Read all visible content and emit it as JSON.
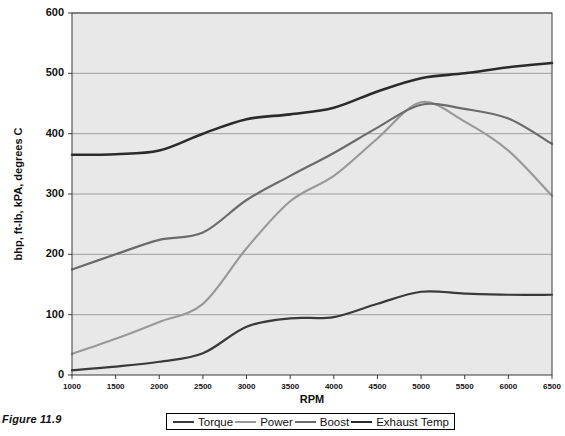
{
  "figure": {
    "caption": "Figure 11.9"
  },
  "chart_data": {
    "type": "line",
    "title": "",
    "xlabel": "RPM",
    "ylabel": "bhp, ft-lb, kPA, degrees C",
    "xlim": [
      1000,
      6500
    ],
    "ylim": [
      0,
      600
    ],
    "xticks": [
      1000,
      1500,
      2000,
      2500,
      3000,
      3500,
      4000,
      4500,
      5000,
      5500,
      6000,
      6500
    ],
    "yticks": [
      0,
      100,
      200,
      300,
      400,
      500,
      600
    ],
    "grid": "horizontal",
    "legend_position": "bottom",
    "plot_background": "#e8e8e8",
    "x": [
      1000,
      1500,
      2000,
      2500,
      3000,
      3500,
      4000,
      4500,
      5000,
      5500,
      6000,
      6500
    ],
    "series": [
      {
        "name": "Torque",
        "color": "#3a3a3a",
        "width": 2.2,
        "values": [
          8,
          14,
          22,
          36,
          80,
          94,
          96,
          118,
          138,
          135,
          133,
          133
        ]
      },
      {
        "name": "Power",
        "color": "#999999",
        "width": 2.2,
        "values": [
          35,
          60,
          88,
          118,
          210,
          288,
          330,
          392,
          452,
          420,
          372,
          297
        ]
      },
      {
        "name": "Boost",
        "color": "#6b6b6b",
        "width": 2.2,
        "values": [
          175,
          200,
          224,
          236,
          290,
          330,
          368,
          410,
          448,
          441,
          425,
          383
        ]
      },
      {
        "name": "Exhaust Temp",
        "color": "#2b2b2b",
        "width": 2.6,
        "values": [
          365,
          366,
          372,
          400,
          424,
          432,
          443,
          470,
          492,
          500,
          510,
          517
        ]
      }
    ]
  }
}
